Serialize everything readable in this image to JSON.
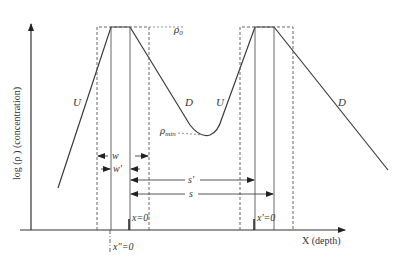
{
  "diagram": {
    "y_axis_label": "log (ρ ) (concentration)",
    "x_axis_label": "X (depth)",
    "rho0_label": "ρ0",
    "rho0_main": "ρ",
    "rho0_sub": "0",
    "rhomin_main": "ρ",
    "rhomin_sub": "min",
    "segments": [
      {
        "label": "U",
        "id": "left-ascent"
      },
      {
        "label": "D",
        "id": "first-descent"
      },
      {
        "label": "U",
        "id": "second-ascent"
      },
      {
        "label": "D",
        "id": "second-descent"
      }
    ],
    "dimensions": [
      {
        "label": "w",
        "id": "width-w"
      },
      {
        "label": "w'",
        "id": "width-w-prime"
      },
      {
        "label": "s'",
        "id": "spacing-s-prime"
      },
      {
        "label": "s",
        "id": "spacing-s"
      }
    ],
    "origins": [
      {
        "label": "x=0",
        "id": "origin-x"
      },
      {
        "label": "x'=0",
        "id": "origin-x-prime"
      },
      {
        "label": "x\"=0",
        "id": "origin-x-double-prime"
      }
    ],
    "colors": {
      "line": "#3a3a3a",
      "dashed": "#555555"
    }
  }
}
